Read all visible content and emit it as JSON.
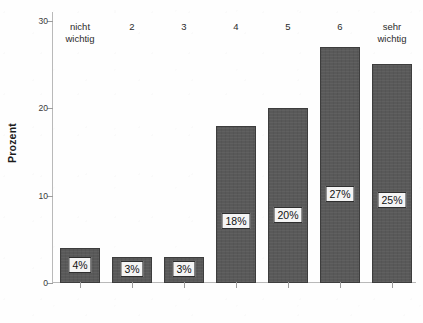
{
  "chart_data": {
    "type": "bar",
    "title": "",
    "xlabel": "",
    "ylabel": "Prozent",
    "categories": [
      "nicht\nwichtig",
      "2",
      "3",
      "4",
      "5",
      "6",
      "sehr wichtig"
    ],
    "values": [
      4,
      3,
      3,
      18,
      20,
      27,
      25
    ],
    "data_labels": [
      "4%",
      "3%",
      "3%",
      "18%",
      "20%",
      "27%",
      "25%"
    ],
    "ylim": [
      0,
      31
    ],
    "yticks": [
      0,
      10,
      20,
      30
    ],
    "ytick_labels": [
      "0",
      "10",
      "20",
      "30"
    ],
    "grid": false,
    "legend": false,
    "bar_color": "#595959",
    "bar_edge_color": "#3d3d3d",
    "axis_color": "#b9b9b9",
    "label_box_background": "#f4f4f4",
    "label_box_border": "#2f2f2f"
  }
}
